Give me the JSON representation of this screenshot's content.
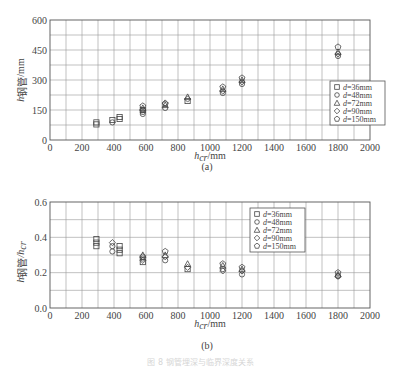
{
  "chart_data": [
    {
      "type": "scatter",
      "panel": "(a)",
      "title": "",
      "xlabel": "h_cr/mm",
      "ylabel": "h_钢管/mm",
      "xlim": [
        0,
        2000
      ],
      "ylim": [
        0,
        600
      ],
      "xticks": [
        0,
        200,
        400,
        600,
        800,
        1000,
        1200,
        1400,
        1600,
        1800,
        2000
      ],
      "yticks": [
        0,
        150,
        300,
        450,
        600
      ],
      "grid": true,
      "legend_position": "lower right",
      "series": [
        {
          "name": "d=36mm",
          "marker": "square",
          "points": [
            [
              290,
              78
            ],
            [
              290,
              88
            ],
            [
              390,
              100
            ],
            [
              435,
              105
            ],
            [
              435,
              115
            ],
            [
              580,
              150
            ],
            [
              860,
              195
            ]
          ]
        },
        {
          "name": "d=48mm",
          "marker": "circle",
          "points": [
            [
              390,
              88
            ],
            [
              580,
              130
            ],
            [
              580,
              140
            ],
            [
              720,
              160
            ],
            [
              1080,
              235
            ],
            [
              1200,
              280
            ],
            [
              1800,
              420
            ]
          ]
        },
        {
          "name": "d=72mm",
          "marker": "triangle",
          "points": [
            [
              580,
              160
            ],
            [
              720,
              175
            ],
            [
              860,
              215
            ],
            [
              1080,
              255
            ],
            [
              1200,
              300
            ],
            [
              1800,
              440
            ]
          ]
        },
        {
          "name": "d=90mm",
          "marker": "diamond",
          "points": [
            [
              580,
              150
            ],
            [
              720,
              185
            ],
            [
              860,
              205
            ],
            [
              1080,
              245
            ],
            [
              1200,
              290
            ],
            [
              1800,
              430
            ]
          ]
        },
        {
          "name": "d=150mm",
          "marker": "pentagon",
          "points": [
            [
              580,
              170
            ],
            [
              720,
              180
            ],
            [
              1080,
              265
            ],
            [
              1200,
              310
            ],
            [
              1800,
              465
            ]
          ]
        }
      ]
    },
    {
      "type": "scatter",
      "panel": "(b)",
      "title": "",
      "xlabel": "h_cr/mm",
      "ylabel": "h_钢管/h_cr",
      "xlim": [
        0,
        2000
      ],
      "ylim": [
        0.0,
        0.6
      ],
      "xticks": [
        0,
        200,
        400,
        600,
        800,
        1000,
        1200,
        1400,
        1600,
        1800,
        2000
      ],
      "yticks": [
        0.0,
        0.2,
        0.4,
        0.6
      ],
      "grid": true,
      "legend_position": "upper center-right",
      "series": [
        {
          "name": "d=36mm",
          "marker": "square",
          "points": [
            [
              290,
              0.35
            ],
            [
              290,
              0.37
            ],
            [
              290,
              0.39
            ],
            [
              435,
              0.31
            ],
            [
              435,
              0.33
            ],
            [
              435,
              0.35
            ],
            [
              580,
              0.26
            ],
            [
              860,
              0.22
            ]
          ]
        },
        {
          "name": "d=48mm",
          "marker": "circle",
          "points": [
            [
              390,
              0.32
            ],
            [
              390,
              0.35
            ],
            [
              580,
              0.28
            ],
            [
              720,
              0.27
            ],
            [
              1080,
              0.22
            ],
            [
              1200,
              0.19
            ],
            [
              1800,
              0.18
            ]
          ]
        },
        {
          "name": "d=72mm",
          "marker": "triangle",
          "points": [
            [
              580,
              0.3
            ],
            [
              720,
              0.3
            ],
            [
              860,
              0.25
            ],
            [
              1080,
              0.24
            ],
            [
              1200,
              0.22
            ],
            [
              1800,
              0.19
            ]
          ]
        },
        {
          "name": "d=90mm",
          "marker": "diamond",
          "points": [
            [
              390,
              0.37
            ],
            [
              580,
              0.27
            ],
            [
              720,
              0.29
            ],
            [
              860,
              0.23
            ],
            [
              1080,
              0.21
            ],
            [
              1200,
              0.21
            ],
            [
              1800,
              0.18
            ]
          ]
        },
        {
          "name": "d=150mm",
          "marker": "pentagon",
          "points": [
            [
              580,
              0.29
            ],
            [
              720,
              0.32
            ],
            [
              1080,
              0.25
            ],
            [
              1200,
              0.23
            ],
            [
              1800,
              0.2
            ]
          ]
        }
      ]
    }
  ],
  "figure": {
    "panel_a_label": "(a)",
    "panel_b_label": "(b)",
    "x_axis_label_main": "h",
    "x_axis_label_sub": "cr",
    "x_axis_unit": "/mm",
    "a_y_axis_label_main": "h",
    "a_y_axis_label_sub": "钢管",
    "a_y_axis_unit": "/mm",
    "b_y_axis_label_main": "h",
    "b_y_axis_label_sub": "钢管",
    "b_y_axis_label_div": "/h",
    "b_y_axis_label_sub2": "cr",
    "legend": [
      {
        "symbol": "□",
        "label": "d=36mm"
      },
      {
        "symbol": "○",
        "label": "d=48mm"
      },
      {
        "symbol": "△",
        "label": "d=72mm"
      },
      {
        "symbol": "◇",
        "label": "d=90mm"
      },
      {
        "symbol": "⬠",
        "label": "d=150mm"
      }
    ],
    "caption": "图 8   钢管埋深与临界深度关系"
  }
}
